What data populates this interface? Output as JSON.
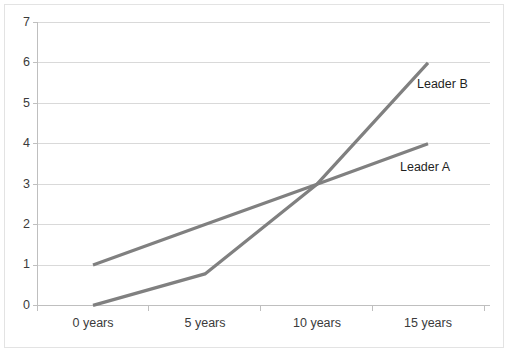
{
  "chart_data": {
    "type": "line",
    "title": "",
    "xlabel": "",
    "ylabel": "",
    "categories": [
      "0 years",
      "5 years",
      "10 years",
      "15 years"
    ],
    "x": [
      0,
      5,
      10,
      15
    ],
    "ylim": [
      0,
      7
    ],
    "yticks": [
      0,
      1,
      2,
      3,
      4,
      5,
      6,
      7
    ],
    "ytick_labels": [
      "0",
      "1",
      "2",
      "3",
      "4",
      "5",
      "6",
      "7"
    ],
    "grid": "horizontal",
    "legend_position": "inline-right-of-line-end",
    "series": [
      {
        "name": "Leader A",
        "values": [
          1,
          2,
          3,
          4
        ],
        "color": "#808080",
        "label": "Leader A"
      },
      {
        "name": "Leader B",
        "values": [
          0,
          0.78,
          3,
          6
        ],
        "color": "#808080",
        "label": "Leader B"
      }
    ],
    "annotations": [
      {
        "text": "Leader B",
        "x": 15,
        "y": 5.6
      },
      {
        "text": "Leader A",
        "x": 15,
        "y": 3.45
      }
    ],
    "colors": {
      "line": "#808080",
      "gridline": "#d9d9d9",
      "axis": "#bfbfbf",
      "text": "#3b3b3b",
      "background": "#ffffff",
      "border": "#e3e3e3"
    }
  },
  "axis": {
    "y_labels": [
      "7",
      "6",
      "5",
      "4",
      "3",
      "2",
      "1",
      "0"
    ],
    "x_labels": [
      "0 years",
      "5 years",
      "10 years",
      "15 years"
    ]
  },
  "series_labels": {
    "leader_b": "Leader B",
    "leader_a": "Leader A"
  }
}
